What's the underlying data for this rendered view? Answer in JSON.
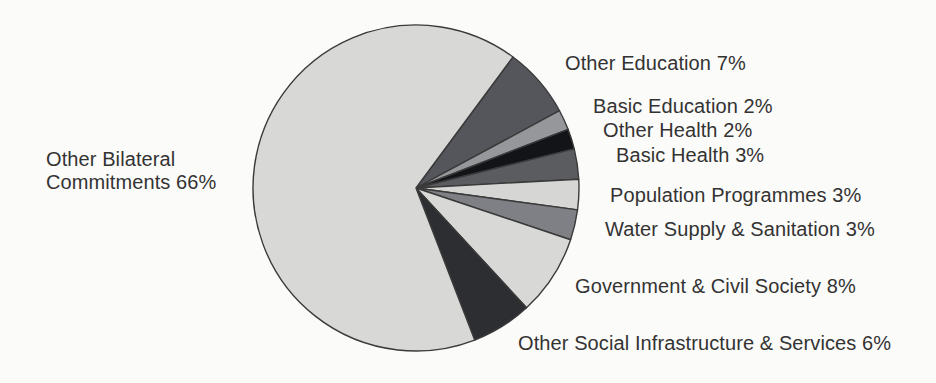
{
  "figure": {
    "background": "#fbfbf9",
    "title": ""
  },
  "chart_data": {
    "type": "pie",
    "title": "",
    "unit": "%",
    "legend_position": "outside-labels",
    "grid": false,
    "start_angle_deg_clockwise_from_north": 36.5,
    "center": {
      "x": 416,
      "y": 188
    },
    "radius": 163,
    "stroke_color": "#3a3a3a",
    "stroke_width": 1.4,
    "categories": [
      "Other Education",
      "Basic Education",
      "Other Health",
      "Basic Health",
      "Population Programmes",
      "Water Supply & Sanitation",
      "Government & Civil Society",
      "Other Social Infrastructure & Services",
      "Other Bilateral Commitments"
    ],
    "values": [
      7,
      2,
      2,
      3,
      3,
      3,
      8,
      6,
      66
    ],
    "slices": [
      {
        "label": "Other Education",
        "value": 7,
        "color": "#54565b",
        "label_pos": {
          "x": 565,
          "y": 52
        }
      },
      {
        "label": "Basic Education",
        "value": 2,
        "color": "#96979b",
        "label_pos": {
          "x": 593,
          "y": 95
        }
      },
      {
        "label": "Other Health",
        "value": 2,
        "color": "#131417",
        "label_pos": {
          "x": 603,
          "y": 119
        }
      },
      {
        "label": "Basic Health",
        "value": 3,
        "color": "#5a5c60",
        "label_pos": {
          "x": 616,
          "y": 144
        }
      },
      {
        "label": "Population Programmes",
        "value": 3,
        "color": "#d6d7d4",
        "label_pos": {
          "x": 610,
          "y": 184
        }
      },
      {
        "label": "Water Supply & Sanitation",
        "value": 3,
        "color": "#7e8085",
        "label_pos": {
          "x": 605,
          "y": 218
        }
      },
      {
        "label": "Government & Civil Society",
        "value": 8,
        "color": "#d8d9d6",
        "label_pos": {
          "x": 575,
          "y": 275
        }
      },
      {
        "label": "Other Social Infrastructure & Services",
        "value": 6,
        "color": "#2d2e31",
        "label_pos": {
          "x": 518,
          "y": 332
        }
      },
      {
        "label": "Other Bilateral Commitments",
        "value": 66,
        "color": "#d8d9d6",
        "label_pos": {
          "x": 46,
          "y": 148,
          "width": 178
        }
      }
    ]
  }
}
